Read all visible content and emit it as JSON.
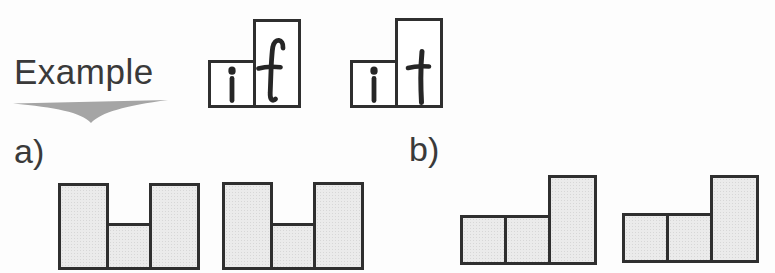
{
  "example": {
    "label": "Example",
    "arrow_icon": "arrow-down",
    "words": [
      {
        "word": "if",
        "letters": [
          {
            "char": "i",
            "box": "short"
          },
          {
            "char": "f",
            "box": "tall"
          }
        ]
      },
      {
        "word": "it",
        "letters": [
          {
            "char": "i",
            "box": "short"
          },
          {
            "char": "t",
            "box": "tall"
          }
        ]
      }
    ]
  },
  "options": [
    {
      "label": "a)",
      "shapes": [
        {
          "pattern": [
            "tall",
            "short",
            "tall"
          ]
        },
        {
          "pattern": [
            "tall",
            "short",
            "tall"
          ]
        }
      ]
    },
    {
      "label": "b)",
      "shapes": [
        {
          "pattern": [
            "short",
            "short",
            "tall"
          ]
        },
        {
          "pattern": [
            "short",
            "short",
            "tall"
          ]
        }
      ]
    }
  ],
  "colors": {
    "background": "#fdfdfd",
    "text": "#3a3a3a",
    "box_border": "#2f2f2f",
    "box_fill": "#ebebeb",
    "letterbox_fill": "#ffffff",
    "letter": "#262626",
    "arrow": "#a5a5a5"
  }
}
